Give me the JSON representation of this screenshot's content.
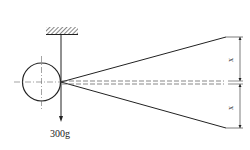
{
  "diagram": {
    "weight_label": "300g",
    "dimension_labels": [
      "x",
      "x"
    ],
    "colors": {
      "stroke": "#222222",
      "centerline": "#666666",
      "background": "#ffffff"
    }
  }
}
